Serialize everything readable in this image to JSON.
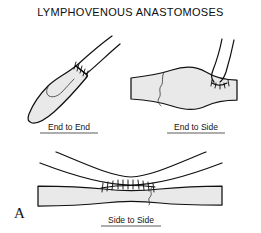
{
  "figure": {
    "title": "LYMPHOVENOUS ANASTOMOSES",
    "panel_letter": "A",
    "background_color": "#ffffff",
    "vessel_fill_color": "#e9e9e9",
    "outline_color": "#111111",
    "panels": [
      {
        "id": "end-to-end",
        "label": "End to End",
        "position": "top-left",
        "description": "Obliquely oriented vessel with a sutured junction joining a wide lower segment to a narrow upper segment"
      },
      {
        "id": "end-to-side",
        "label": "End to Side",
        "position": "top-right",
        "description": "Horizontal vessel with a branching vessel sutured onto its superior side"
      },
      {
        "id": "side-to-side",
        "label": "Side to Side",
        "position": "bottom",
        "description": "Two parallel vessels joined along a longitudinal sutured line"
      }
    ]
  }
}
